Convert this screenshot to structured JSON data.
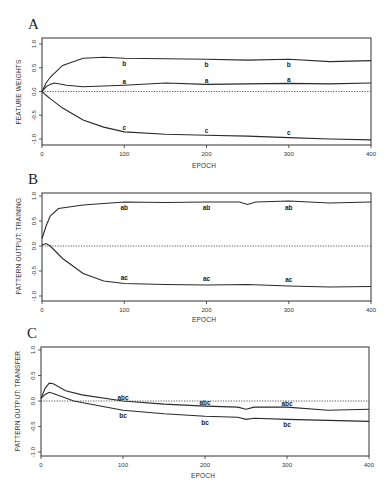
{
  "chart_data": [
    {
      "type": "line",
      "panel": "A",
      "title": "",
      "xlabel": "EPOCH",
      "ylabel": "FEATURE WEIGHTS",
      "xlim": [
        0,
        400
      ],
      "ylim": [
        -1.1,
        1.1
      ],
      "xticks": [
        0,
        100,
        200,
        300,
        400
      ],
      "yticks": [
        1.0,
        0.5,
        0.0,
        -0.5,
        -1.0
      ],
      "ytick_labels": [
        "1.0",
        "0.5",
        "0.0",
        "-0.5",
        "-1.0"
      ],
      "grid": false,
      "reference_line": {
        "y": 0.0,
        "style": "dotted"
      },
      "series": [
        {
          "name": "b",
          "x": [
            0,
            5,
            10,
            25,
            50,
            75,
            100,
            150,
            200,
            250,
            300,
            350,
            400
          ],
          "values": [
            0.0,
            0.18,
            0.3,
            0.55,
            0.7,
            0.72,
            0.7,
            0.69,
            0.68,
            0.66,
            0.68,
            0.63,
            0.65
          ],
          "label_at": [
            100,
            200,
            300
          ]
        },
        {
          "name": "a",
          "x": [
            0,
            5,
            10,
            15,
            30,
            50,
            100,
            150,
            200,
            250,
            300,
            350,
            400
          ],
          "values": [
            0.0,
            0.1,
            0.15,
            0.18,
            0.13,
            0.1,
            0.13,
            0.18,
            0.15,
            0.16,
            0.17,
            0.16,
            0.18
          ],
          "label_at": [
            100,
            200,
            300
          ]
        },
        {
          "name": "c",
          "x": [
            0,
            5,
            10,
            25,
            50,
            75,
            100,
            150,
            200,
            250,
            300,
            350,
            400
          ],
          "values": [
            0.0,
            -0.08,
            -0.15,
            -0.35,
            -0.6,
            -0.75,
            -0.85,
            -0.9,
            -0.92,
            -0.94,
            -0.97,
            -1.0,
            -1.02
          ],
          "label_at": [
            100,
            200,
            300
          ]
        }
      ]
    },
    {
      "type": "line",
      "panel": "B",
      "title": "",
      "xlabel": "EPOCH",
      "ylabel": "PATTERN OUTPUT: TRAINING",
      "xlim": [
        0,
        400
      ],
      "ylim": [
        -1.1,
        1.1
      ],
      "xticks": [
        0,
        100,
        200,
        300,
        400
      ],
      "yticks": [
        1.0,
        0.5,
        0.0,
        -0.5,
        -1.0
      ],
      "ytick_labels": [
        "1.0",
        "0.5",
        "0.0",
        "-0.5",
        "-1.0"
      ],
      "grid": false,
      "reference_line": {
        "y": 0.0,
        "style": "dotted"
      },
      "series": [
        {
          "name": "ab",
          "x": [
            0,
            5,
            10,
            20,
            50,
            100,
            150,
            200,
            240,
            250,
            260,
            300,
            350,
            400
          ],
          "values": [
            0.15,
            0.4,
            0.6,
            0.75,
            0.82,
            0.88,
            0.87,
            0.88,
            0.88,
            0.83,
            0.88,
            0.9,
            0.86,
            0.88
          ],
          "label_at": [
            100,
            200,
            300
          ]
        },
        {
          "name": "ac",
          "x": [
            0,
            5,
            10,
            25,
            50,
            75,
            100,
            150,
            200,
            250,
            300,
            350,
            400
          ],
          "values": [
            0.02,
            0.05,
            0.0,
            -0.25,
            -0.55,
            -0.7,
            -0.75,
            -0.77,
            -0.78,
            -0.77,
            -0.8,
            -0.82,
            -0.81
          ],
          "label_at": [
            100,
            200,
            300
          ]
        }
      ]
    },
    {
      "type": "line",
      "panel": "C",
      "title": "",
      "xlabel": "EPOCH",
      "ylabel": "PATTERN OUTPUT: TRANSFER",
      "xlim": [
        0,
        400
      ],
      "ylim": [
        -1.1,
        1.1
      ],
      "xticks": [
        0,
        100,
        200,
        300,
        400
      ],
      "yticks": [
        1.0,
        0.5,
        0.0,
        -0.5,
        -1.0
      ],
      "ytick_labels": [
        "1.0",
        "0.5",
        "0.0",
        "-0.5",
        "-1.0"
      ],
      "grid": false,
      "reference_line": {
        "y": 0.0,
        "style": "dotted"
      },
      "series": [
        {
          "name": "abc",
          "x": [
            0,
            5,
            10,
            15,
            30,
            50,
            100,
            150,
            200,
            240,
            250,
            260,
            300,
            350,
            400
          ],
          "values": [
            0.05,
            0.25,
            0.35,
            0.34,
            0.2,
            0.12,
            0.0,
            -0.06,
            -0.1,
            -0.12,
            -0.16,
            -0.12,
            -0.12,
            -0.18,
            -0.16
          ],
          "label_at": [
            100,
            200,
            300
          ]
        },
        {
          "name": "bc",
          "x": [
            0,
            5,
            10,
            15,
            40,
            100,
            150,
            200,
            240,
            250,
            260,
            300,
            350,
            400
          ],
          "values": [
            0.05,
            0.13,
            0.17,
            0.15,
            0.0,
            -0.18,
            -0.25,
            -0.3,
            -0.32,
            -0.36,
            -0.34,
            -0.36,
            -0.38,
            -0.4
          ],
          "label_at": [
            100,
            200,
            300
          ]
        }
      ]
    }
  ],
  "panels": [
    {
      "letter": "A",
      "ylabel": "FEATURE WEIGHTS",
      "xlabel": "EPOCH",
      "labels": [
        {
          "text": "b",
          "x": 100,
          "y": 0.58
        },
        {
          "text": "b",
          "x": 200,
          "y": 0.56
        },
        {
          "text": "b",
          "x": 300,
          "y": 0.56
        },
        {
          "text": "a",
          "x": 100,
          "y": 0.2
        },
        {
          "text": "a",
          "x": 200,
          "y": 0.22
        },
        {
          "text": "a",
          "x": 300,
          "y": 0.24
        },
        {
          "text": "c",
          "x": 100,
          "y": -0.76
        },
        {
          "text": "c",
          "x": 200,
          "y": -0.84
        },
        {
          "text": "c",
          "x": 300,
          "y": -0.88
        }
      ]
    },
    {
      "letter": "B",
      "ylabel": "PATTERN OUTPUT:  TRAINING",
      "xlabel": "EPOCH",
      "labels": [
        {
          "text": "ab",
          "x": 100,
          "y": 0.76
        },
        {
          "text": "ab",
          "x": 200,
          "y": 0.76
        },
        {
          "text": "ab",
          "x": 300,
          "y": 0.76
        },
        {
          "text": "ac",
          "x": 100,
          "y": -0.64
        },
        {
          "text": "ac",
          "x": 200,
          "y": -0.66
        },
        {
          "text": "ac",
          "x": 300,
          "y": -0.68
        }
      ]
    },
    {
      "letter": "C",
      "ylabel": "PATTERN OUTPUT:  TRANSFER",
      "xlabel": "EPOCH",
      "labels": [
        {
          "text": "abc",
          "x": 100,
          "y": 0.05
        },
        {
          "text": "abc",
          "x": 200,
          "y": -0.03
        },
        {
          "text": "abc",
          "x": 300,
          "y": -0.05
        },
        {
          "text": "bc",
          "x": 100,
          "y": -0.3
        },
        {
          "text": "bc",
          "x": 200,
          "y": -0.44
        },
        {
          "text": "bc",
          "x": 300,
          "y": -0.48
        }
      ]
    }
  ],
  "colors": {
    "line": "#2a2a2a",
    "frame": "#333333",
    "background": "#ffffff"
  }
}
